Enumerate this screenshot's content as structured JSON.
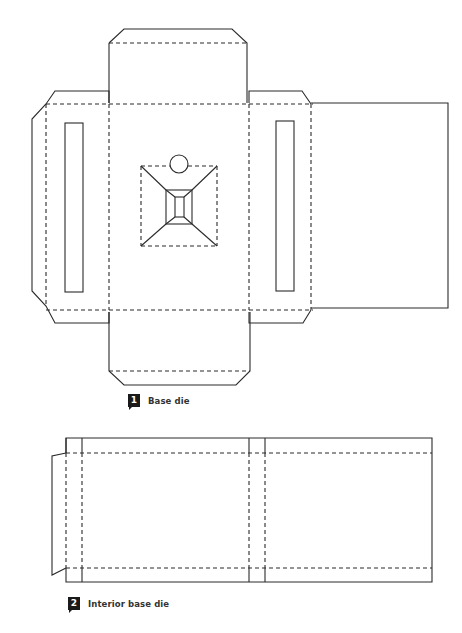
{
  "figures": [
    {
      "number": "1",
      "caption": "Base die",
      "components": [
        "top-flap",
        "bottom-flap",
        "left-side-panel-with-slot",
        "right-side-panel-with-slot",
        "base-panel",
        "pyramid-mount-with-circle",
        "right-extension-panel"
      ]
    },
    {
      "number": "2",
      "caption": "Interior base die",
      "components": [
        "left-glue-tab",
        "left-narrow-strips",
        "left-main-panel",
        "center-narrow-strips",
        "right-main-panel"
      ]
    }
  ],
  "colors": {
    "line": "#2a2a2a",
    "badge": "#1a1a1a",
    "caption_text": "#333333",
    "background": "#ffffff"
  },
  "legend": {
    "solid_line": "cut line",
    "dashed_line": "fold line"
  }
}
